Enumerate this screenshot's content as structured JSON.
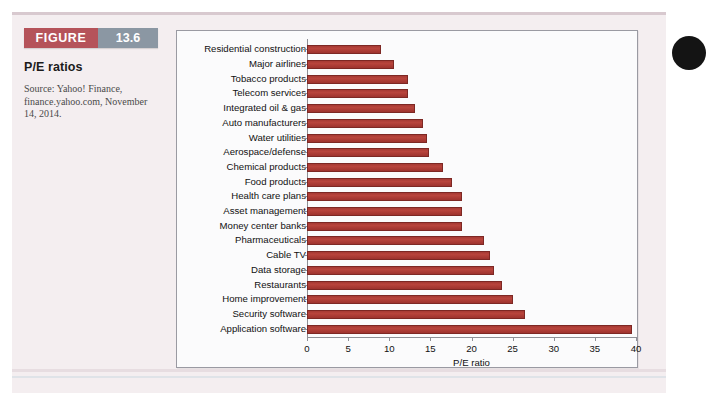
{
  "figure": {
    "tag_word": "FIGURE",
    "tag_number": "13.6",
    "title": "P/E ratios",
    "source": "Source: Yahoo! Finance, finance.yahoo.com, November 14, 2014."
  },
  "colors": {
    "tag_word_bg": "#b5535a",
    "tag_number_bg": "#8b97a3",
    "bar_fill": "#a63a34",
    "bar_stroke": "#7d2824",
    "panel_bg": "#f4eef0",
    "chart_bg": "#fbfbfc"
  },
  "chart_data": {
    "type": "bar",
    "orientation": "horizontal",
    "title": "P/E ratios",
    "xlabel": "P/E ratio",
    "ylabel": "",
    "xlim": [
      0,
      40
    ],
    "xticks": [
      0,
      5,
      10,
      15,
      20,
      25,
      30,
      35,
      40
    ],
    "grid": false,
    "legend": false,
    "categories": [
      "Residential construction",
      "Major airlines",
      "Tobacco products",
      "Telecom services",
      "Integrated oil & gas",
      "Auto manufacturers",
      "Water utilities",
      "Aerospace/defense",
      "Chemical products",
      "Food products",
      "Health care plans",
      "Asset management",
      "Money center banks",
      "Pharmaceuticals",
      "Cable TV",
      "Data storage",
      "Restaurants",
      "Home improvement",
      "Security software",
      "Application software"
    ],
    "values": [
      9.0,
      10.6,
      12.3,
      12.3,
      13.1,
      14.1,
      14.6,
      14.8,
      16.5,
      17.6,
      18.8,
      18.8,
      18.9,
      21.5,
      22.3,
      22.7,
      23.7,
      25.0,
      26.5,
      39.5
    ]
  }
}
